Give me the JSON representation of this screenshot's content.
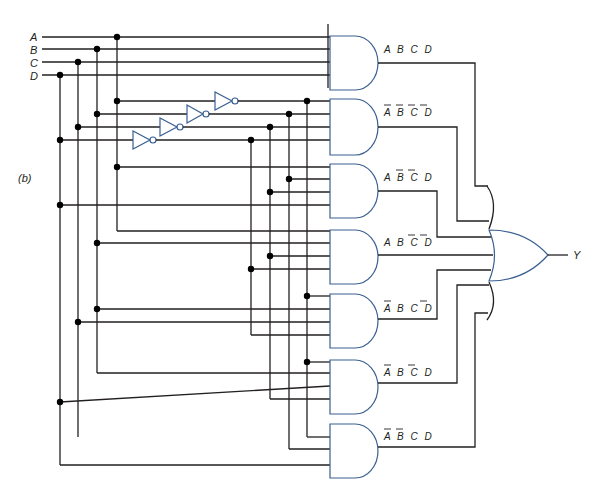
{
  "figure": {
    "label": "(b)",
    "inputs": [
      "A",
      "B",
      "C",
      "D"
    ],
    "output": "Y",
    "colors": {
      "wire": "#231f20",
      "gate_outline": "#3a5f91",
      "junction": "#000000"
    }
  },
  "gates": {
    "inverters": [
      {
        "input": "A",
        "output": "A-bar"
      },
      {
        "input": "B",
        "output": "B-bar"
      },
      {
        "input": "C",
        "output": "C-bar"
      },
      {
        "input": "D",
        "output": "D-bar"
      }
    ],
    "and_gates": [
      {
        "id": "and1",
        "terms": [
          {
            "v": "A",
            "neg": false
          },
          {
            "v": "B",
            "neg": false
          },
          {
            "v": "C",
            "neg": false
          },
          {
            "v": "D",
            "neg": false
          }
        ]
      },
      {
        "id": "and2",
        "terms": [
          {
            "v": "A",
            "neg": true
          },
          {
            "v": "B",
            "neg": true
          },
          {
            "v": "C",
            "neg": true
          },
          {
            "v": "D",
            "neg": true
          }
        ]
      },
      {
        "id": "and3",
        "terms": [
          {
            "v": "A",
            "neg": false
          },
          {
            "v": "B",
            "neg": true
          },
          {
            "v": "C",
            "neg": true
          },
          {
            "v": "D",
            "neg": false
          }
        ]
      },
      {
        "id": "and4",
        "terms": [
          {
            "v": "A",
            "neg": false
          },
          {
            "v": "B",
            "neg": false
          },
          {
            "v": "C",
            "neg": true
          },
          {
            "v": "D",
            "neg": true
          }
        ]
      },
      {
        "id": "and5",
        "terms": [
          {
            "v": "A",
            "neg": true
          },
          {
            "v": "B",
            "neg": false
          },
          {
            "v": "C",
            "neg": false
          },
          {
            "v": "D",
            "neg": true
          }
        ]
      },
      {
        "id": "and6",
        "terms": [
          {
            "v": "A",
            "neg": true
          },
          {
            "v": "B",
            "neg": false
          },
          {
            "v": "C",
            "neg": true
          },
          {
            "v": "D",
            "neg": false
          }
        ]
      },
      {
        "id": "and7",
        "terms": [
          {
            "v": "A",
            "neg": true
          },
          {
            "v": "B",
            "neg": true
          },
          {
            "v": "C",
            "neg": false
          },
          {
            "v": "D",
            "neg": false
          }
        ]
      }
    ],
    "or_gate": {
      "inputs": 7,
      "output": "Y"
    }
  }
}
